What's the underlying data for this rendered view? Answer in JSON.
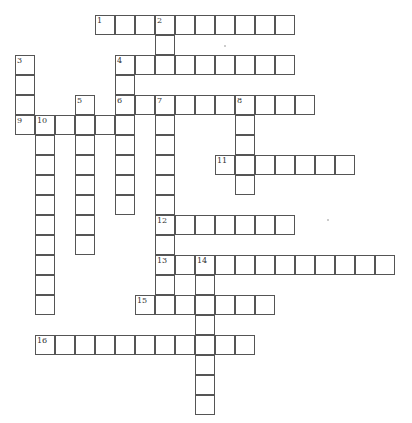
{
  "puzzle": {
    "type": "crossword",
    "cell_size": 20,
    "origin": {
      "x": 15,
      "y": 15
    },
    "entries": [
      {
        "number": 1,
        "direction": "across",
        "row": 0,
        "col": 4,
        "length": 10
      },
      {
        "number": 2,
        "direction": "down",
        "row": 0,
        "col": 7,
        "length": 3
      },
      {
        "number": 3,
        "direction": "down",
        "row": 2,
        "col": 0,
        "length": 4
      },
      {
        "number": 4,
        "direction": "across",
        "row": 2,
        "col": 5,
        "length": 9
      },
      {
        "number": 4,
        "direction": "down",
        "row": 2,
        "col": 5,
        "length": 8
      },
      {
        "number": 5,
        "direction": "down",
        "row": 4,
        "col": 3,
        "length": 8
      },
      {
        "number": 6,
        "direction": "across",
        "row": 4,
        "col": 5,
        "length": 10
      },
      {
        "number": 7,
        "direction": "down",
        "row": 4,
        "col": 7,
        "length": 11
      },
      {
        "number": 8,
        "direction": "down",
        "row": 4,
        "col": 11,
        "length": 5
      },
      {
        "number": 9,
        "direction": "across",
        "row": 5,
        "col": 0,
        "length": 6
      },
      {
        "number": 10,
        "direction": "down",
        "row": 5,
        "col": 1,
        "length": 10
      },
      {
        "number": 11,
        "direction": "across",
        "row": 7,
        "col": 10,
        "length": 7
      },
      {
        "number": 12,
        "direction": "across",
        "row": 10,
        "col": 7,
        "length": 7
      },
      {
        "number": 13,
        "direction": "across",
        "row": 12,
        "col": 7,
        "length": 12
      },
      {
        "number": 14,
        "direction": "down",
        "row": 12,
        "col": 9,
        "length": 8
      },
      {
        "number": 15,
        "direction": "across",
        "row": 14,
        "col": 6,
        "length": 7
      },
      {
        "number": 16,
        "direction": "across",
        "row": 16,
        "col": 1,
        "length": 11
      }
    ]
  },
  "colors": {
    "border": "#555555",
    "background": "#ffffff",
    "number": "#333333"
  }
}
